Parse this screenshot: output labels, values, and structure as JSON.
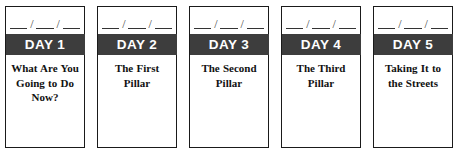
{
  "document": {
    "type": "five-day-planner-strip",
    "card_count": 5,
    "date_field": {
      "separator": "/",
      "blank_segments": 3,
      "pattern": "__/__/__"
    },
    "colors": {
      "banner_background": "#3d3d3d",
      "banner_text": "#ffffff",
      "card_border": "#1a1a1a",
      "card_background": "#ffffff",
      "body_text": "#111111"
    }
  },
  "cards": [
    {
      "banner_label": "DAY 1",
      "title": "What Are You Going to Do Now?"
    },
    {
      "banner_label": "DAY 2",
      "title": "The First Pillar"
    },
    {
      "banner_label": "DAY 3",
      "title": "The Second Pillar"
    },
    {
      "banner_label": "DAY 4",
      "title": "The Third Pillar"
    },
    {
      "banner_label": "DAY 5",
      "title": "Taking It to the Streets"
    }
  ]
}
